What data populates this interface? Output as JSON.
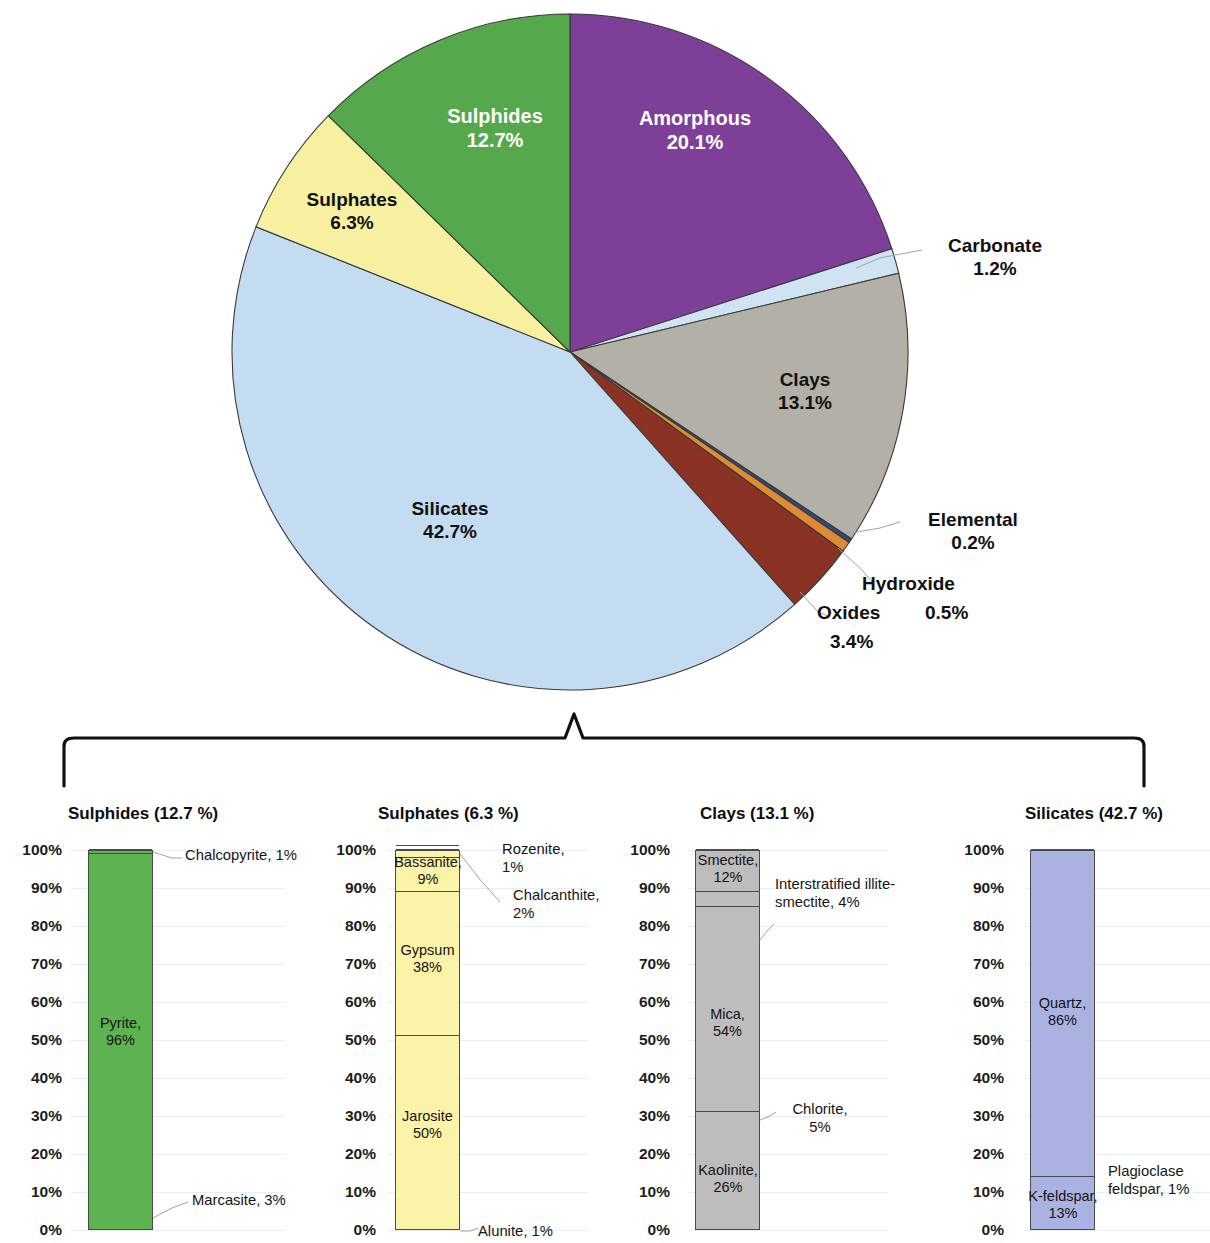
{
  "chart_data": [
    {
      "type": "pie",
      "title": "",
      "legend": "labels on slices",
      "categories": [
        "Amorphous",
        "Carbonate",
        "Clays",
        "Elemental",
        "Hydroxide",
        "Oxides",
        "Silicates",
        "Sulphates",
        "Sulphides"
      ],
      "values": [
        20.1,
        1.2,
        13.1,
        0.2,
        0.5,
        3.4,
        42.7,
        6.3,
        12.7
      ],
      "slices": [
        {
          "name": "Amorphous",
          "value": 20.1,
          "label": "Amorphous",
          "value_label": "20.1%",
          "color": "#7d3f98",
          "placement": "inside",
          "text_color": "light"
        },
        {
          "name": "Carbonate",
          "value": 1.2,
          "label": "Carbonate",
          "value_label": "1.2%",
          "color": "#cfe3f2",
          "placement": "outside",
          "text_color": "dark"
        },
        {
          "name": "Clays",
          "value": 13.1,
          "label": "Clays",
          "value_label": "13.1%",
          "color": "#b3b0a8",
          "placement": "inside",
          "text_color": "dark"
        },
        {
          "name": "Elemental",
          "value": 0.2,
          "label": "Elemental",
          "value_label": "0.2%",
          "color": "#2e4a7d",
          "placement": "outside",
          "text_color": "dark"
        },
        {
          "name": "Hydroxide",
          "value": 0.5,
          "label": "Hydroxide",
          "value_label": "0.5%",
          "color": "#e08b32",
          "placement": "outside",
          "text_color": "dark"
        },
        {
          "name": "Oxides",
          "value": 3.4,
          "label": "Oxides",
          "value_label": "3.4%",
          "color": "#8a3324",
          "placement": "outside",
          "text_color": "dark"
        },
        {
          "name": "Silicates",
          "value": 42.7,
          "label": "Silicates",
          "value_label": "42.7%",
          "color": "#c3dcf2",
          "placement": "inside",
          "text_color": "dark"
        },
        {
          "name": "Sulphates",
          "value": 6.3,
          "label": "Sulphates",
          "value_label": "6.3%",
          "color": "#f7f0a0",
          "placement": "inside",
          "text_color": "dark"
        },
        {
          "name": "Sulphides",
          "value": 12.7,
          "label": "Sulphides",
          "value_label": "12.7%",
          "color": "#55a84b",
          "placement": "inside",
          "text_color": "light"
        }
      ]
    },
    {
      "type": "bar",
      "subtype": "stacked-100",
      "title": "Sulphides (12.7 %)",
      "ylabel": "",
      "ylim": [
        0,
        100
      ],
      "ticks": [
        "0%",
        "10%",
        "20%",
        "30%",
        "40%",
        "50%",
        "60%",
        "70%",
        "80%",
        "90%",
        "100%"
      ],
      "color": "#5cb34f",
      "categories": [
        "Marcasite",
        "Pyrite",
        "Chalcopyrite"
      ],
      "values": [
        3,
        96,
        1
      ],
      "segments": [
        {
          "name": "Marcasite",
          "value": 3,
          "label_line1": "Marcasite, 3%",
          "label_line2": "",
          "placement": "callout",
          "value_label": "3%"
        },
        {
          "name": "Pyrite",
          "value": 96,
          "label_line1": "Pyrite,",
          "label_line2": "96%",
          "placement": "inside",
          "value_label": "96%"
        },
        {
          "name": "Chalcopyrite",
          "value": 1,
          "label_line1": "Chalcopyrite, 1%",
          "label_line2": "",
          "placement": "callout",
          "value_label": "1%"
        }
      ]
    },
    {
      "type": "bar",
      "subtype": "stacked-100",
      "title": "Sulphates (6.3 %)",
      "ylabel": "",
      "ylim": [
        0,
        100
      ],
      "ticks": [
        "0%",
        "10%",
        "20%",
        "30%",
        "40%",
        "50%",
        "60%",
        "70%",
        "80%",
        "90%",
        "100%"
      ],
      "color": "#faf3a8",
      "categories": [
        "Alunite",
        "Jarosite",
        "Gypsum",
        "Bassanite",
        "Chalcanthite",
        "Rozenite"
      ],
      "values": [
        1,
        50,
        38,
        9,
        2,
        1
      ],
      "segments": [
        {
          "name": "Alunite",
          "value": 1,
          "label_line1": "Alunite, 1%",
          "label_line2": "",
          "placement": "callout",
          "value_label": "1%"
        },
        {
          "name": "Jarosite",
          "value": 50,
          "label_line1": "Jarosite",
          "label_line2": "50%",
          "placement": "inside",
          "value_label": "50%"
        },
        {
          "name": "Gypsum",
          "value": 38,
          "label_line1": "Gypsum",
          "label_line2": "38%",
          "placement": "inside",
          "value_label": "38%"
        },
        {
          "name": "Bassanite",
          "value": 9,
          "label_line1": "Bassanite,",
          "label_line2": "9%",
          "placement": "inside",
          "value_label": "9%"
        },
        {
          "name": "Chalcanthite",
          "value": 2,
          "label_line1": "Chalcanthite,",
          "label_line2": "2%",
          "placement": "callout",
          "value_label": "2%"
        },
        {
          "name": "Rozenite",
          "value": 1,
          "label_line1": "Rozenite,",
          "label_line2": "1%",
          "placement": "callout",
          "value_label": "1%"
        }
      ]
    },
    {
      "type": "bar",
      "subtype": "stacked-100",
      "title": "Clays (13.1 %)",
      "ylabel": "",
      "ylim": [
        0,
        100
      ],
      "ticks": [
        "0%",
        "10%",
        "20%",
        "30%",
        "40%",
        "50%",
        "60%",
        "70%",
        "80%",
        "90%",
        "100%"
      ],
      "color": "#bdbdbd",
      "categories": [
        "Kaolinite",
        "Chlorite",
        "Mica",
        "Interstratified illite-smectite",
        "Smectite"
      ],
      "values": [
        26,
        5,
        54,
        4,
        12
      ],
      "segments": [
        {
          "name": "Kaolinite",
          "value": 26,
          "label_line1": "Kaolinite,",
          "label_line2": "26%",
          "placement": "inside",
          "value_label": "26%"
        },
        {
          "name": "Chlorite",
          "value": 5,
          "label_line1": "Chlorite,",
          "label_line2": "5%",
          "placement": "callout",
          "value_label": "5%"
        },
        {
          "name": "Mica",
          "value": 54,
          "label_line1": "Mica,",
          "label_line2": "54%",
          "placement": "inside",
          "value_label": "54%"
        },
        {
          "name": "Interstratified illite-smectite",
          "value": 4,
          "label_line1": "Interstratified illite-",
          "label_line2": "smectite, 4%",
          "placement": "callout",
          "value_label": "4%"
        },
        {
          "name": "Smectite",
          "value": 12,
          "label_line1": "Smectite,",
          "label_line2": "12%",
          "placement": "inside",
          "value_label": "12%"
        }
      ]
    },
    {
      "type": "bar",
      "subtype": "stacked-100",
      "title": "Silicates (42.7 %)",
      "ylabel": "",
      "ylim": [
        0,
        100
      ],
      "ticks": [
        "0%",
        "10%",
        "20%",
        "30%",
        "40%",
        "50%",
        "60%",
        "70%",
        "80%",
        "90%",
        "100%"
      ],
      "color": "#aab2e2",
      "categories": [
        "K-feldspar",
        "Plagioclase feldspar",
        "Quartz"
      ],
      "values": [
        13,
        1,
        86
      ],
      "segments": [
        {
          "name": "K-feldspar",
          "value": 13,
          "label_line1": "K-feldspar,",
          "label_line2": "13%",
          "placement": "inside",
          "value_label": "13%"
        },
        {
          "name": "Plagioclase feldspar",
          "value": 1,
          "label_line1": "Plagioclase",
          "label_line2": "feldspar, 1%",
          "placement": "callout",
          "value_label": "1%"
        },
        {
          "name": "Quartz",
          "value": 86,
          "label_line1": "Quartz,",
          "label_line2": "86%",
          "placement": "inside",
          "value_label": "86%"
        }
      ]
    }
  ],
  "pie": {
    "amorphous": {
      "name": "Amorphous",
      "pct": "20.1%"
    },
    "sulphides": {
      "name": "Sulphides",
      "pct": "12.7%"
    },
    "sulphates": {
      "name": "Sulphates",
      "pct": "6.3%"
    },
    "silicates": {
      "name": "Silicates",
      "pct": "42.7%"
    },
    "clays": {
      "name": "Clays",
      "pct": "13.1%"
    },
    "carbonate": {
      "name": "Carbonate",
      "pct": "1.2%"
    },
    "elemental": {
      "name": "Elemental",
      "pct": "0.2%"
    },
    "hydroxide": {
      "name": "Hydroxide",
      "pct": "0.5%"
    },
    "oxides": {
      "name": "Oxides",
      "pct": "3.4%"
    }
  },
  "panels": {
    "sulphides": {
      "title": "Sulphides (12.7 %)",
      "ticks": [
        "100%",
        "90%",
        "80%",
        "70%",
        "60%",
        "50%",
        "40%",
        "30%",
        "20%",
        "10%",
        "0%"
      ],
      "pyrite_l1": "Pyrite,",
      "pyrite_l2": "96%",
      "chalcopyrite": "Chalcopyrite, 1%",
      "marcasite": "Marcasite, 3%"
    },
    "sulphates": {
      "title": "Sulphates (6.3 %)",
      "ticks": [
        "100%",
        "90%",
        "80%",
        "70%",
        "60%",
        "50%",
        "40%",
        "30%",
        "20%",
        "10%",
        "0%"
      ],
      "bassanite_l1": "Bassanite,",
      "bassanite_l2": "9%",
      "gypsum_l1": "Gypsum",
      "gypsum_l2": "38%",
      "jarosite_l1": "Jarosite",
      "jarosite_l2": "50%",
      "rozenite_l1": "Rozenite,",
      "rozenite_l2": "1%",
      "chalcanthite_l1": "Chalcanthite,",
      "chalcanthite_l2": "2%",
      "alunite": "Alunite, 1%"
    },
    "clays": {
      "title": "Clays (13.1 %)",
      "ticks": [
        "100%",
        "90%",
        "80%",
        "70%",
        "60%",
        "50%",
        "40%",
        "30%",
        "20%",
        "10%",
        "0%"
      ],
      "smectite_l1": "Smectite,",
      "smectite_l2": "12%",
      "mica_l1": "Mica,",
      "mica_l2": "54%",
      "kaolinite_l1": "Kaolinite,",
      "kaolinite_l2": "26%",
      "illite_l1": "Interstratified illite-",
      "illite_l2": "smectite, 4%",
      "chlorite_l1": "Chlorite,",
      "chlorite_l2": "5%"
    },
    "silicates": {
      "title": "Silicates (42.7 %)",
      "ticks": [
        "100%",
        "90%",
        "80%",
        "70%",
        "60%",
        "50%",
        "40%",
        "30%",
        "20%",
        "10%",
        "0%"
      ],
      "quartz_l1": "Quartz,",
      "quartz_l2": "86%",
      "kfeldspar_l1": "K-feldspar,",
      "kfeldspar_l2": "13%",
      "plagioclase_l1": "Plagioclase",
      "plagioclase_l2": "feldspar, 1%"
    }
  }
}
